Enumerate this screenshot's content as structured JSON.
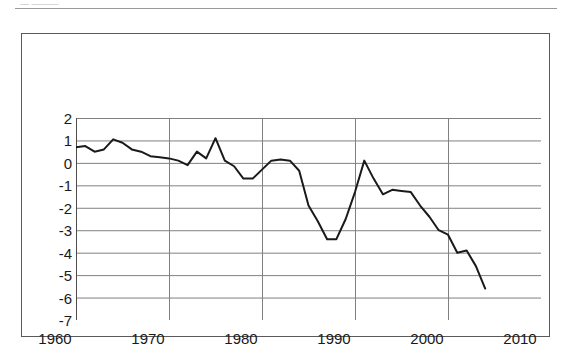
{
  "page": {
    "clipped_header_text": "— ———",
    "figure_frame_color": "#5a5a5a"
  },
  "chart_data": {
    "type": "line",
    "title": "",
    "subtitle": "",
    "xlabel": "",
    "ylabel": "",
    "xlim": [
      1960,
      2010
    ],
    "ylim": [
      -7,
      2
    ],
    "xticks": [
      1960,
      1970,
      1980,
      1990,
      2000,
      2010
    ],
    "xtick_labels": [
      "1960",
      "1970",
      "1980",
      "1990",
      "2000",
      "2010"
    ],
    "yticks": [
      2,
      1,
      0,
      -1,
      -2,
      -3,
      -4,
      -5,
      -6,
      -7
    ],
    "ytick_labels": [
      "2",
      "1",
      "0",
      "-1",
      "-2",
      "-3",
      "-4",
      "-5",
      "-6",
      "-7"
    ],
    "grid": "both",
    "grid_color": "#808080",
    "legend": "none",
    "line_color": "#1a1a1a",
    "line_width": 2,
    "markers": "none",
    "x": [
      1960,
      1961,
      1962,
      1963,
      1964,
      1965,
      1966,
      1967,
      1968,
      1969,
      1970,
      1971,
      1972,
      1973,
      1974,
      1975,
      1976,
      1977,
      1978,
      1979,
      1980,
      1981,
      1982,
      1983,
      1984,
      1985,
      1986,
      1987,
      1988,
      1989,
      1990,
      1991,
      1992,
      1993,
      1994,
      1995,
      1996,
      1997,
      1998,
      1999,
      2000,
      2001,
      2002,
      2003,
      2004
    ],
    "series": [
      {
        "name": "series-1",
        "values": [
          0.7,
          0.75,
          0.5,
          0.6,
          1.05,
          0.9,
          0.6,
          0.5,
          0.3,
          0.25,
          0.2,
          0.1,
          -0.1,
          0.5,
          0.2,
          1.1,
          0.1,
          -0.15,
          -0.7,
          -0.7,
          -0.3,
          0.1,
          0.15,
          0.1,
          -0.35,
          -1.9,
          -2.6,
          -3.4,
          -3.4,
          -2.5,
          -1.3,
          0.1,
          -0.7,
          -1.4,
          -1.2,
          -1.25,
          -1.3,
          -1.9,
          -2.4,
          -3.0,
          -3.2,
          -4.0,
          -3.9,
          -4.6,
          -5.6
        ]
      }
    ],
    "annotations": []
  }
}
